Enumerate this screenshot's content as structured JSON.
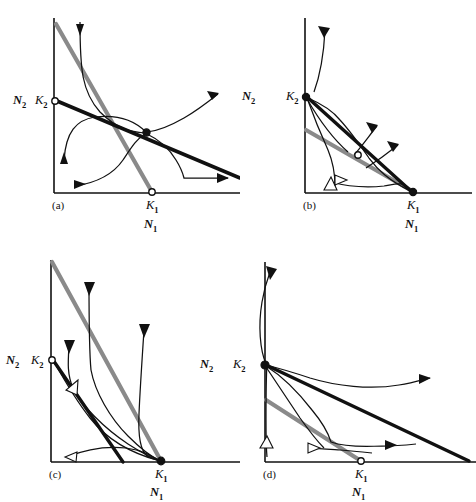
{
  "figure": {
    "type": "phase-plane-diagram-set",
    "axis_label_x": "N",
    "axis_label_x_sub": "1",
    "axis_label_y": "N",
    "axis_label_y_sub": "2",
    "carrying_capacity_1": "K",
    "carrying_capacity_1_sub": "1",
    "carrying_capacity_2": "K",
    "carrying_capacity_2_sub": "2",
    "colors": {
      "isocline_species1_gray": "#8a8a8a",
      "isocline_species2_black": "#111111",
      "trajectory": "#111111",
      "axis": "#111111",
      "background": "#ffffff"
    }
  },
  "panels": [
    {
      "id": "a",
      "caption": "(a)",
      "k1_marker": "open-circle",
      "k2_marker": "open-circle",
      "interior_equilibrium": "filled-circle",
      "outcome": "unstable-equilibrium-saddle",
      "labels": {
        "n2": "N",
        "n2_sub": "2",
        "k2": "K",
        "k2_sub": "2",
        "k1": "K",
        "k1_sub": "1",
        "n1": "N",
        "n1_sub": "1"
      }
    },
    {
      "id": "b",
      "caption": "(b)",
      "k1_marker": "filled-circle",
      "k2_marker": "filled-circle",
      "interior_equilibrium": "open-circle",
      "outcome": "bistable-unstable-interior",
      "labels": {
        "n2": "N",
        "n2_sub": "2",
        "k2": "K",
        "k2_sub": "2",
        "k1": "K",
        "k1_sub": "1",
        "n1": "N",
        "n1_sub": "1"
      }
    },
    {
      "id": "c",
      "caption": "(c)",
      "k1_marker": "filled-circle",
      "k2_marker": "open-circle",
      "interior_equilibrium": "none",
      "outcome": "species-1-wins",
      "labels": {
        "n2": "N",
        "n2_sub": "2",
        "k2": "K",
        "k2_sub": "2",
        "k1": "K",
        "k1_sub": "1",
        "n1": "N",
        "n1_sub": "1"
      }
    },
    {
      "id": "d",
      "caption": "(d)",
      "k1_marker": "open-circle",
      "k2_marker": "filled-circle",
      "interior_equilibrium": "none",
      "outcome": "species-2-wins",
      "labels": {
        "n2": "N",
        "n2_sub": "2",
        "k2": "K",
        "k2_sub": "2",
        "k1": "K",
        "k1_sub": "1",
        "n1": "N",
        "n1_sub": "1"
      }
    }
  ]
}
